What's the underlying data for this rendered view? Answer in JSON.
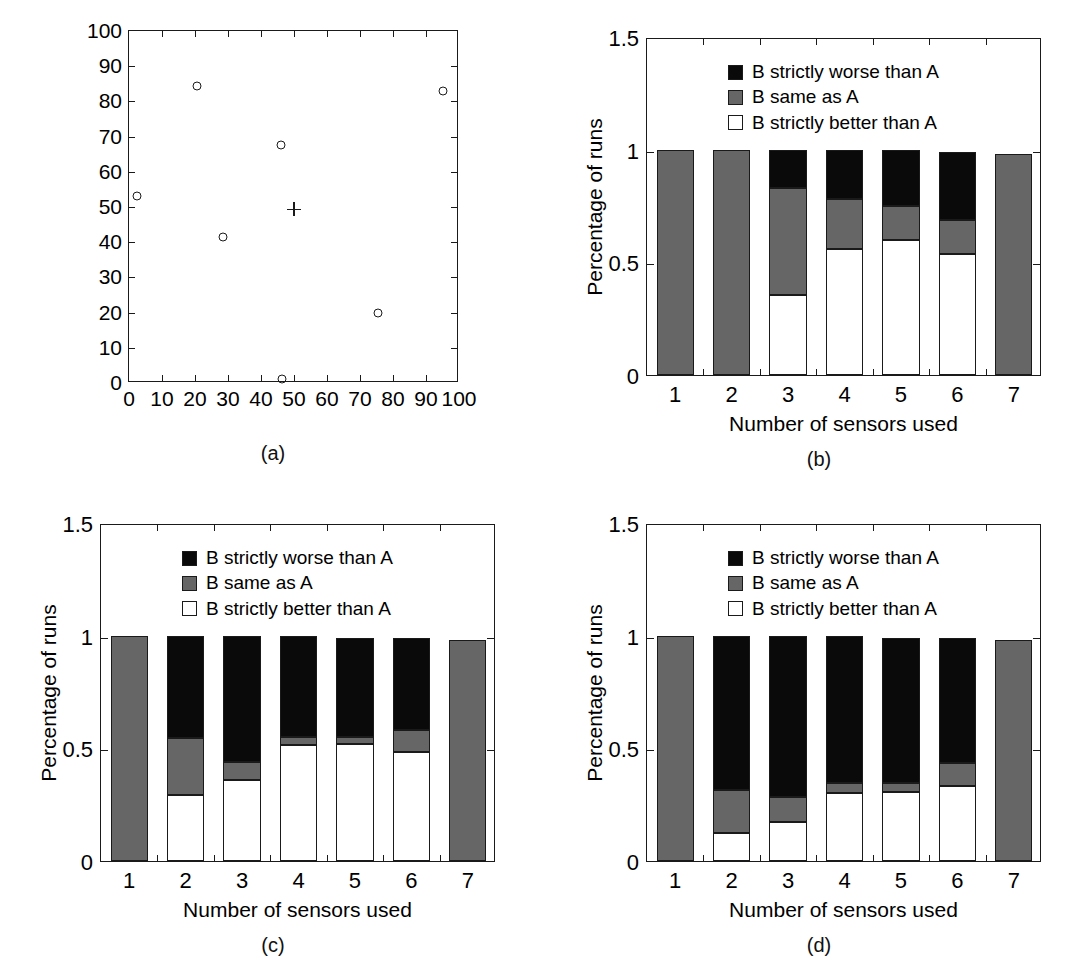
{
  "figure": {
    "panels": [
      "(a)",
      "(b)",
      "(c)",
      "(d)"
    ]
  },
  "chart_data": [
    {
      "type": "scatter",
      "panel": "(a)",
      "title": "",
      "xlabel": "",
      "ylabel": "",
      "xlim": [
        0,
        100
      ],
      "ylim": [
        0,
        100
      ],
      "xticks": [
        0,
        10,
        20,
        30,
        40,
        50,
        60,
        70,
        80,
        90,
        100
      ],
      "yticks": [
        0,
        10,
        20,
        30,
        40,
        50,
        60,
        70,
        80,
        90,
        100
      ],
      "grid": false,
      "legend": "none",
      "series": [
        {
          "name": "sensors",
          "marker": "circle",
          "points": [
            {
              "x": 2.5,
              "y": 53.0
            },
            {
              "x": 20.5,
              "y": 84.5
            },
            {
              "x": 28.5,
              "y": 41.5
            },
            {
              "x": 46.0,
              "y": 67.5
            },
            {
              "x": 46.5,
              "y": 1.2
            },
            {
              "x": 75.5,
              "y": 20.0
            },
            {
              "x": 95.0,
              "y": 83.0
            }
          ]
        },
        {
          "name": "target",
          "marker": "plus",
          "points": [
            {
              "x": 50.0,
              "y": 49.3
            }
          ]
        }
      ]
    },
    {
      "type": "bar",
      "panel": "(b)",
      "stacked": true,
      "title": "",
      "xlabel": "Number of sensors used",
      "ylabel": "Percentage of runs",
      "categories": [
        "1",
        "2",
        "3",
        "4",
        "5",
        "6",
        "7"
      ],
      "ylim": [
        0,
        1.5
      ],
      "yticks": [
        "0",
        "0.5",
        "1",
        "1.5"
      ],
      "ytick_values": [
        0,
        0.5,
        1,
        1.5
      ],
      "grid": false,
      "legend_position": "top-center",
      "series": [
        {
          "name": "B strictly better than A",
          "color": "#ffffff",
          "values": [
            0.0,
            0.0,
            0.355,
            0.56,
            0.6,
            0.535,
            0.0
          ]
        },
        {
          "name": "B same as A",
          "color": "#666666",
          "values": [
            1.0,
            1.0,
            0.475,
            0.22,
            0.15,
            0.155,
            0.98
          ]
        },
        {
          "name": "B strictly worse than A",
          "color": "#0a0a0a",
          "values": [
            0.0,
            0.0,
            0.17,
            0.22,
            0.25,
            0.3,
            0.0
          ]
        }
      ]
    },
    {
      "type": "bar",
      "panel": "(c)",
      "stacked": true,
      "title": "",
      "xlabel": "Number of sensors used",
      "ylabel": "Percentage of runs",
      "categories": [
        "1",
        "2",
        "3",
        "4",
        "5",
        "6",
        "7"
      ],
      "ylim": [
        0,
        1.5
      ],
      "yticks": [
        "0",
        "0.5",
        "1",
        "1.5"
      ],
      "ytick_values": [
        0,
        0.5,
        1,
        1.5
      ],
      "grid": false,
      "legend_position": "top-center",
      "series": [
        {
          "name": "B strictly better than A",
          "color": "#ffffff",
          "values": [
            0.0,
            0.295,
            0.36,
            0.515,
            0.52,
            0.485,
            0.0
          ]
        },
        {
          "name": "B same as A",
          "color": "#666666",
          "values": [
            1.0,
            0.25,
            0.08,
            0.035,
            0.03,
            0.095,
            0.98
          ]
        },
        {
          "name": "B strictly worse than A",
          "color": "#0a0a0a",
          "values": [
            0.0,
            0.455,
            0.56,
            0.45,
            0.44,
            0.41,
            0.0
          ]
        }
      ]
    },
    {
      "type": "bar",
      "panel": "(d)",
      "stacked": true,
      "title": "",
      "xlabel": "Number of sensors used",
      "ylabel": "Percentage of runs",
      "categories": [
        "1",
        "2",
        "3",
        "4",
        "5",
        "6",
        "7"
      ],
      "ylim": [
        0,
        1.5
      ],
      "yticks": [
        "0",
        "0.5",
        "1",
        "1.5"
      ],
      "ytick_values": [
        0,
        0.5,
        1,
        1.5
      ],
      "grid": false,
      "legend_position": "top-center",
      "series": [
        {
          "name": "B strictly better than A",
          "color": "#ffffff",
          "values": [
            0.0,
            0.125,
            0.175,
            0.3,
            0.305,
            0.335,
            0.0
          ]
        },
        {
          "name": "B same as A",
          "color": "#666666",
          "values": [
            1.0,
            0.19,
            0.11,
            0.045,
            0.04,
            0.1,
            0.98
          ]
        },
        {
          "name": "B strictly worse than A",
          "color": "#0a0a0a",
          "values": [
            0.0,
            0.685,
            0.715,
            0.655,
            0.645,
            0.555,
            0.0
          ]
        }
      ]
    }
  ]
}
